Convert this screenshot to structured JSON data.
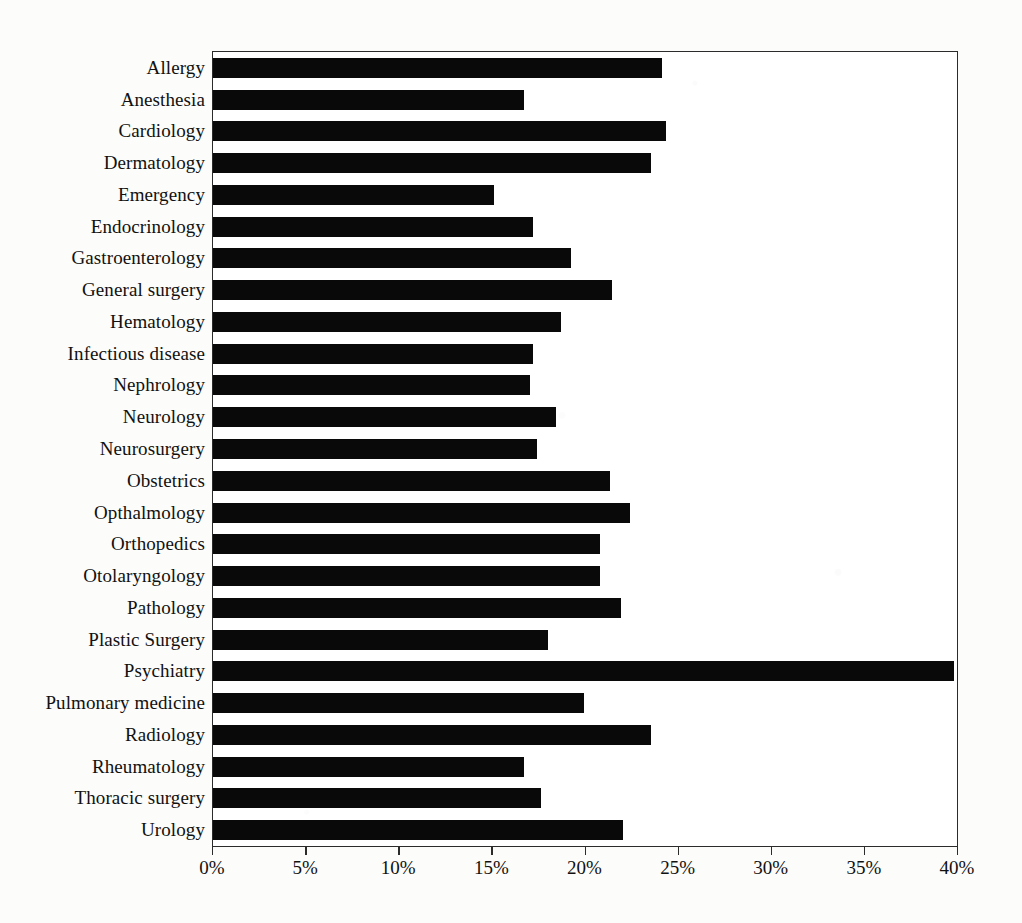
{
  "chart_data": {
    "type": "bar",
    "orientation": "horizontal",
    "title": "",
    "subtitle": "",
    "xlabel": "",
    "ylabel": "",
    "xlim": [
      0,
      40
    ],
    "xunit": "%",
    "grid": false,
    "legend": null,
    "tick_labels": [
      "0%",
      "5%",
      "10%",
      "15%",
      "20%",
      "25%",
      "30%",
      "35%",
      "40%"
    ],
    "tick_values": [
      0,
      5,
      10,
      15,
      20,
      25,
      30,
      35,
      40
    ],
    "bar_color": "#090909",
    "axis_color": "#2b2b2b",
    "background_color": "#fcfcfa",
    "categories": [
      "Allergy",
      "Anesthesia",
      "Cardiology",
      "Dermatology",
      "Emergency",
      "Endocrinology",
      "Gastroenterology",
      "General surgery",
      "Hematology",
      "Infectious disease",
      "Nephrology",
      "Neurology",
      "Neurosurgery",
      "Obstetrics",
      "Opthalmology",
      "Orthopedics",
      "Otolaryngology",
      "Pathology",
      "Plastic Surgery",
      "Psychiatry",
      "Pulmonary medicine",
      "Radiology",
      "Rheumatology",
      "Thoracic surgery",
      "Urology"
    ],
    "values": [
      24.1,
      16.7,
      24.3,
      23.5,
      15.1,
      17.2,
      19.2,
      21.4,
      18.7,
      17.2,
      17.0,
      18.4,
      17.4,
      21.3,
      22.4,
      20.8,
      20.8,
      21.9,
      18.0,
      39.8,
      19.9,
      23.5,
      16.7,
      17.6,
      22.0
    ]
  }
}
